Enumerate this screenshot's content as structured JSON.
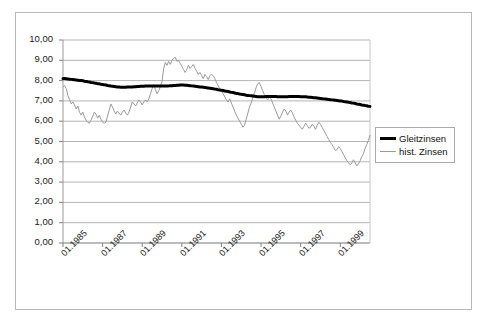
{
  "chart_data": {
    "type": "line",
    "title": "",
    "xlabel": "",
    "ylabel": "",
    "ylim": [
      0,
      10
    ],
    "ytick_step": 1,
    "grid": true,
    "legend_position": "right",
    "y_tick_labels": [
      "10,00",
      "9,00",
      "8,00",
      "7,00",
      "6,00",
      "5,00",
      "4,00",
      "3,00",
      "2,00",
      "1,00",
      "0,00"
    ],
    "x_tick_labels": [
      "01.1985",
      "01.1987",
      "01.1989",
      "01.1991",
      "01.1993",
      "01.1995",
      "01.1997",
      "01.1999"
    ],
    "x_start": "01.1985",
    "x_end": "07.2000",
    "x_point_count": 187,
    "series": [
      {
        "name": "Gleitzinsen",
        "color": "#000000",
        "width": 3,
        "values": [
          8.1,
          8.1,
          8.09,
          8.08,
          8.07,
          8.06,
          8.05,
          8.04,
          8.03,
          8.02,
          8.01,
          8.0,
          7.99,
          7.97,
          7.96,
          7.94,
          7.93,
          7.91,
          7.9,
          7.88,
          7.87,
          7.85,
          7.84,
          7.82,
          7.81,
          7.79,
          7.78,
          7.76,
          7.75,
          7.73,
          7.72,
          7.71,
          7.7,
          7.69,
          7.68,
          7.67,
          7.67,
          7.67,
          7.67,
          7.68,
          7.68,
          7.69,
          7.69,
          7.7,
          7.7,
          7.71,
          7.71,
          7.72,
          7.72,
          7.72,
          7.73,
          7.73,
          7.73,
          7.73,
          7.73,
          7.73,
          7.73,
          7.73,
          7.73,
          7.73,
          7.73,
          7.73,
          7.73,
          7.74,
          7.74,
          7.75,
          7.75,
          7.76,
          7.76,
          7.77,
          7.77,
          7.78,
          7.78,
          7.78,
          7.77,
          7.77,
          7.76,
          7.75,
          7.74,
          7.73,
          7.72,
          7.71,
          7.7,
          7.69,
          7.68,
          7.67,
          7.66,
          7.65,
          7.63,
          7.62,
          7.61,
          7.6,
          7.58,
          7.57,
          7.55,
          7.54,
          7.52,
          7.51,
          7.49,
          7.47,
          7.46,
          7.44,
          7.42,
          7.41,
          7.39,
          7.37,
          7.36,
          7.34,
          7.33,
          7.31,
          7.3,
          7.28,
          7.27,
          7.26,
          7.25,
          7.24,
          7.23,
          7.22,
          7.21,
          7.21,
          7.21,
          7.21,
          7.21,
          7.22,
          7.22,
          7.22,
          7.22,
          7.22,
          7.22,
          7.22,
          7.21,
          7.21,
          7.21,
          7.21,
          7.21,
          7.21,
          7.21,
          7.22,
          7.22,
          7.22,
          7.22,
          7.22,
          7.22,
          7.22,
          7.21,
          7.21,
          7.2,
          7.2,
          7.19,
          7.18,
          7.18,
          7.17,
          7.16,
          7.15,
          7.14,
          7.13,
          7.12,
          7.11,
          7.1,
          7.09,
          7.08,
          7.07,
          7.06,
          7.05,
          7.04,
          7.03,
          7.02,
          7.01,
          7.0,
          6.99,
          6.97,
          6.96,
          6.95,
          6.93,
          6.92,
          6.9,
          6.89,
          6.87,
          6.85,
          6.84,
          6.82,
          6.8,
          6.79,
          6.77,
          6.76,
          6.74,
          6.73
        ]
      },
      {
        "name": "hist. Zinsen",
        "color": "#9a9a9a",
        "width": 1,
        "values": [
          7.7,
          7.75,
          7.6,
          7.25,
          7.05,
          6.85,
          6.95,
          6.8,
          6.6,
          6.75,
          6.45,
          6.3,
          6.45,
          6.2,
          6.05,
          5.95,
          5.9,
          6.05,
          6.25,
          6.45,
          6.35,
          6.15,
          6.3,
          6.1,
          5.95,
          5.9,
          5.95,
          6.25,
          6.55,
          6.85,
          6.7,
          6.5,
          6.35,
          6.5,
          6.4,
          6.3,
          6.45,
          6.55,
          6.4,
          6.3,
          6.45,
          6.7,
          6.95,
          6.85,
          6.75,
          6.9,
          7.05,
          6.95,
          6.8,
          6.95,
          7.05,
          6.95,
          7.1,
          7.35,
          7.6,
          7.8,
          7.55,
          7.35,
          7.5,
          7.7,
          7.95,
          8.6,
          8.9,
          8.75,
          8.95,
          8.8,
          9.0,
          9.1,
          9.15,
          8.95,
          9.0,
          8.85,
          8.7,
          8.55,
          8.4,
          8.55,
          8.75,
          8.6,
          8.7,
          8.8,
          8.6,
          8.45,
          8.3,
          8.4,
          8.25,
          8.1,
          8.3,
          8.2,
          8.05,
          8.25,
          8.3,
          8.25,
          8.1,
          7.9,
          7.75,
          7.6,
          7.5,
          7.35,
          7.2,
          7.05,
          6.95,
          7.1,
          6.9,
          6.7,
          6.5,
          6.3,
          6.15,
          6.0,
          5.85,
          5.7,
          5.8,
          6.1,
          6.4,
          6.7,
          6.9,
          7.15,
          7.4,
          7.65,
          7.85,
          7.9,
          7.7,
          7.5,
          7.3,
          7.15,
          7.05,
          7.2,
          7.1,
          6.9,
          6.7,
          6.5,
          6.3,
          6.1,
          6.25,
          6.45,
          6.6,
          6.5,
          6.3,
          6.45,
          6.55,
          6.4,
          6.2,
          6.05,
          5.9,
          5.8,
          5.7,
          5.6,
          5.75,
          5.9,
          5.8,
          5.65,
          5.7,
          5.85,
          5.75,
          5.6,
          5.8,
          5.95,
          5.85,
          5.7,
          5.55,
          5.4,
          5.25,
          5.1,
          4.95,
          4.85,
          4.7,
          4.55,
          4.6,
          4.75,
          4.65,
          4.5,
          4.35,
          4.2,
          4.05,
          3.95,
          3.85,
          3.95,
          4.1,
          3.95,
          3.8,
          3.9,
          4.05,
          4.25,
          4.4,
          4.65,
          4.85,
          5.05,
          5.3
        ]
      }
    ]
  },
  "legend": {
    "items": [
      {
        "label": "Gleitzinsen"
      },
      {
        "label": "hist. Zinsen"
      }
    ]
  }
}
